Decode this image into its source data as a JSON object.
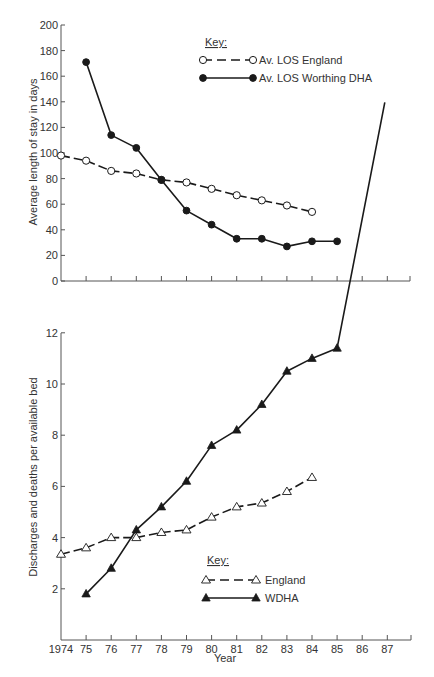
{
  "chart_data": [
    {
      "type": "line",
      "title": "",
      "xlabel": "",
      "ylabel": "Average length of stay in days",
      "ylim": [
        0,
        200
      ],
      "yticks": [
        0,
        20,
        40,
        60,
        80,
        100,
        120,
        140,
        160,
        180,
        200
      ],
      "xlim": [
        1974,
        1988
      ],
      "grid": false,
      "legend_title": "Key:",
      "legend_position": "upper right",
      "series": [
        {
          "name": "Av. LOS England",
          "style": "dashed",
          "marker": "open-circle",
          "x": [
            1974,
            1975,
            1976,
            1977,
            1978,
            1979,
            1980,
            1981,
            1982,
            1983,
            1984
          ],
          "values": [
            98,
            94,
            86,
            84,
            79,
            77,
            72,
            67,
            63,
            59,
            54
          ]
        },
        {
          "name": "Av. LOS Worthing DHA",
          "style": "solid",
          "marker": "filled-circle",
          "x": [
            1975,
            1976,
            1977,
            1978,
            1979,
            1980,
            1981,
            1982,
            1983,
            1984,
            1985
          ],
          "values": [
            171,
            114,
            104,
            79,
            55,
            44,
            33,
            33,
            27,
            31,
            31
          ]
        }
      ]
    },
    {
      "type": "line",
      "title": "",
      "xlabel": "Year",
      "ylabel": "Discharges and deaths per available bed",
      "ylim": [
        0,
        12
      ],
      "yticks": [
        2,
        4,
        6,
        8,
        10,
        12
      ],
      "categories": [
        "1974",
        "75",
        "76",
        "77",
        "78",
        "79",
        "80",
        "81",
        "82",
        "83",
        "84",
        "85",
        "86",
        "87"
      ],
      "xlim": [
        1974,
        1988
      ],
      "grid": false,
      "legend_title": "Key:",
      "legend_position": "lower right",
      "series": [
        {
          "name": "England",
          "style": "dashed",
          "marker": "open-triangle",
          "x": [
            1974,
            1975,
            1976,
            1977,
            1978,
            1979,
            1980,
            1981,
            1982,
            1983,
            1984
          ],
          "values": [
            3.35,
            3.6,
            4.0,
            4.0,
            4.2,
            4.3,
            4.8,
            5.2,
            5.35,
            5.8,
            6.35
          ]
        },
        {
          "name": "WDHA",
          "style": "solid",
          "marker": "filled-triangle",
          "x": [
            1975,
            1976,
            1977,
            1978,
            1979,
            1980,
            1981,
            1982,
            1983,
            1984,
            1985
          ],
          "values": [
            1.8,
            2.8,
            4.3,
            5.2,
            6.2,
            7.6,
            8.2,
            9.2,
            10.5,
            11.0,
            11.4
          ],
          "continuation": {
            "from_x": 1985,
            "to_x": 1986.9,
            "to_value": 21.0,
            "note": "line continues steeply upward beyond plot area into upper panel"
          }
        }
      ]
    }
  ],
  "labels": {
    "top_ylabel": "Average length of stay in days",
    "bottom_ylabel": "Discharges and deaths per available bed",
    "xlabel": "Year",
    "top_key": "Key:",
    "bottom_key": "Key:"
  }
}
